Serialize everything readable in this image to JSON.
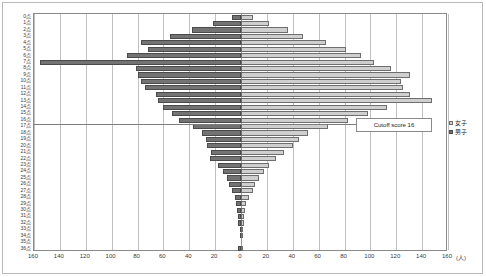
{
  "chart_data": {
    "type": "bar",
    "subtype": "population-pyramid",
    "title": "",
    "xlabel": "",
    "ylabel": "",
    "unit_label": "(人)",
    "orientation": "horizontal-diverging",
    "grid": true,
    "legend_position": "right",
    "axis": {
      "left_ticks": [
        160,
        140,
        120,
        100,
        80,
        60,
        40,
        20,
        0
      ],
      "right_ticks": [
        0,
        20,
        40,
        60,
        80,
        100,
        120,
        140,
        160
      ],
      "max": 160,
      "tick_step": 20
    },
    "categories": [
      "0点",
      "1点",
      "2点",
      "3点",
      "4点",
      "5点",
      "6点",
      "7点",
      "8点",
      "9点",
      "10点",
      "11点",
      "12点",
      "13点",
      "14点",
      "15点",
      "16点",
      "17点",
      "18点",
      "19点",
      "20点",
      "21点",
      "22点",
      "23点",
      "24点",
      "25点",
      "26点",
      "27点",
      "28点",
      "29点",
      "30点",
      "31点",
      "32点",
      "33点",
      "34点",
      "35点",
      "36点"
    ],
    "series": [
      {
        "name": "男子",
        "side": "left",
        "color": "#737373",
        "values": [
          7,
          22,
          38,
          55,
          77,
          72,
          88,
          155,
          81,
          80,
          77,
          74,
          66,
          64,
          60,
          53,
          48,
          37,
          30,
          27,
          26,
          23,
          24,
          18,
          14,
          11,
          9,
          7,
          5,
          4,
          3,
          2,
          2,
          1,
          1,
          0,
          2
        ]
      },
      {
        "name": "女子",
        "side": "right",
        "color": "#cfcfcf",
        "values": [
          9,
          22,
          36,
          48,
          66,
          81,
          93,
          103,
          116,
          131,
          124,
          125,
          131,
          148,
          113,
          98,
          83,
          67,
          52,
          45,
          40,
          33,
          27,
          22,
          18,
          14,
          11,
          9,
          6,
          4,
          3,
          2,
          2,
          1,
          1,
          0,
          1
        ]
      }
    ],
    "annotations": [
      {
        "id": "cutoff",
        "label": "Cutoff score 16",
        "at_category": "16点"
      }
    ]
  },
  "legend": {
    "items": [
      {
        "label": "女子",
        "key": "female"
      },
      {
        "label": "男子",
        "key": "male"
      }
    ]
  },
  "callout": {
    "text": "Cutoff score 16"
  },
  "colors": {
    "male": "#737373",
    "female": "#cfcfcf",
    "grid": "#c0c0c0",
    "axis": "#8a8a8a"
  }
}
